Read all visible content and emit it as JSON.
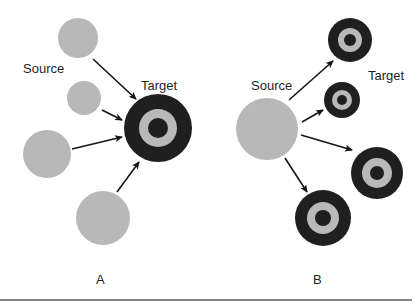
{
  "colors": {
    "background": "#ffffff",
    "source_fill": "#b8b8b8",
    "target_dark": "#1f1f1f",
    "target_ring": "#b9b9b9",
    "arrow": "#151515",
    "rule": "#5a5a5a"
  },
  "panel_a": {
    "caption": "A",
    "source_label": "Source",
    "target_label": "Target",
    "sources": [
      {
        "cx": 78,
        "cy": 38,
        "r": 20
      },
      {
        "cx": 84,
        "cy": 98,
        "r": 17
      },
      {
        "cx": 47,
        "cy": 154,
        "r": 24
      },
      {
        "cx": 103,
        "cy": 218,
        "r": 27
      }
    ],
    "target": {
      "cx": 158,
      "cy": 128,
      "r": 34,
      "ring_r": 19,
      "core_r": 10
    },
    "arrows": [
      {
        "x1": 93,
        "y1": 59,
        "x2": 136,
        "y2": 99
      },
      {
        "x1": 102,
        "y1": 110,
        "x2": 122,
        "y2": 120
      },
      {
        "x1": 72,
        "y1": 149,
        "x2": 122,
        "y2": 137
      },
      {
        "x1": 117,
        "y1": 192,
        "x2": 139,
        "y2": 162
      }
    ]
  },
  "panel_b": {
    "caption": "B",
    "source_label": "Source",
    "target_label": "Target",
    "source": {
      "cx": 267,
      "cy": 129,
      "r": 31
    },
    "targets": [
      {
        "cx": 350,
        "cy": 40,
        "r": 22,
        "ring_r": 12,
        "core_r": 6
      },
      {
        "cx": 342,
        "cy": 100,
        "r": 18,
        "ring_r": 10,
        "core_r": 5
      },
      {
        "cx": 377,
        "cy": 173,
        "r": 26,
        "ring_r": 15,
        "core_r": 7
      },
      {
        "cx": 323,
        "cy": 218,
        "r": 28,
        "ring_r": 16,
        "core_r": 8
      }
    ],
    "arrows": [
      {
        "x1": 289,
        "y1": 100,
        "x2": 333,
        "y2": 61
      },
      {
        "x1": 302,
        "y1": 122,
        "x2": 323,
        "y2": 110
      },
      {
        "x1": 301,
        "y1": 135,
        "x2": 352,
        "y2": 150
      },
      {
        "x1": 285,
        "y1": 158,
        "x2": 307,
        "y2": 192
      }
    ]
  }
}
